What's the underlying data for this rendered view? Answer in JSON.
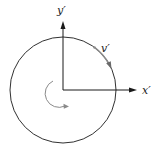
{
  "diagram": {
    "type": "rotating-frame-circle",
    "labels": {
      "y_axis": "y′",
      "x_axis": "x′",
      "velocity": "v′"
    },
    "colors": {
      "line": "#1a1a1a",
      "arrow_gray": "#8a8a8a",
      "background": "#ffffff"
    },
    "geometry": {
      "circle_center": [
        63,
        90
      ],
      "circle_radius": 53,
      "origin": [
        63,
        90
      ],
      "y_axis_end": [
        63,
        22
      ],
      "x_axis_end": [
        137,
        90
      ]
    }
  }
}
